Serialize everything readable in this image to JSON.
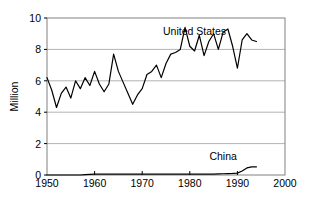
{
  "chart_data": {
    "type": "line",
    "title": "",
    "xlabel": "",
    "ylabel": "Million",
    "xlim": [
      1950,
      2000
    ],
    "ylim": [
      0,
      10
    ],
    "xticks": [
      1950,
      1960,
      1970,
      1980,
      1990,
      2000
    ],
    "yticks": [
      0,
      2,
      4,
      6,
      8,
      10
    ],
    "xtick_labels": [
      "1950",
      "1960",
      "1970",
      "1980",
      "1990",
      "2000"
    ],
    "ytick_labels": [
      "0",
      "2",
      "4",
      "6",
      "8",
      "10"
    ],
    "grid": "horizontal",
    "legend_position": "inline-annotation",
    "line_color": "#000000",
    "grid_color": "#b3b3b3",
    "axis_color": "#808080",
    "x": [
      1950,
      1951,
      1952,
      1953,
      1954,
      1955,
      1956,
      1957,
      1958,
      1959,
      1960,
      1961,
      1962,
      1963,
      1964,
      1965,
      1966,
      1967,
      1968,
      1969,
      1970,
      1971,
      1972,
      1973,
      1974,
      1975,
      1976,
      1977,
      1978,
      1979,
      1980,
      1981,
      1982,
      1983,
      1984,
      1985,
      1986,
      1987,
      1988,
      1989,
      1990,
      1991,
      1992,
      1993,
      1994
    ],
    "series": [
      {
        "name": "United States",
        "label": "United States",
        "label_x": 1981,
        "label_y": 8.9,
        "values": [
          6.2,
          5.4,
          4.3,
          5.2,
          5.6,
          4.9,
          6.0,
          5.5,
          6.2,
          5.7,
          6.6,
          5.8,
          5.3,
          5.8,
          7.7,
          6.6,
          5.9,
          5.2,
          4.5,
          5.1,
          5.5,
          6.4,
          6.6,
          7.0,
          6.2,
          7.1,
          7.7,
          7.8,
          8.0,
          9.4,
          8.2,
          7.9,
          8.9,
          7.6,
          8.5,
          9.0,
          8.0,
          9.1,
          9.3,
          8.2,
          6.8,
          8.6,
          9.0,
          8.6,
          8.5
        ]
      },
      {
        "name": "China",
        "label": "China",
        "label_x": 1987,
        "label_y": 0.95,
        "values": [
          0.0,
          0.0,
          0.0,
          0.0,
          0.0,
          0.0,
          0.0,
          0.0,
          0.03,
          0.04,
          0.05,
          0.05,
          0.05,
          0.05,
          0.05,
          0.05,
          0.05,
          0.05,
          0.05,
          0.05,
          0.05,
          0.05,
          0.05,
          0.05,
          0.05,
          0.05,
          0.05,
          0.05,
          0.05,
          0.05,
          0.05,
          0.05,
          0.05,
          0.05,
          0.05,
          0.06,
          0.07,
          0.08,
          0.09,
          0.1,
          0.12,
          0.25,
          0.45,
          0.52,
          0.52
        ]
      }
    ]
  }
}
